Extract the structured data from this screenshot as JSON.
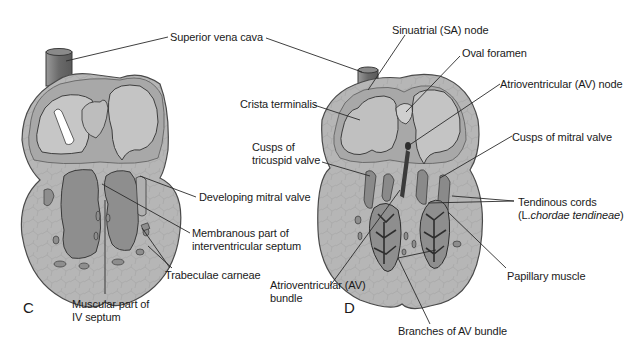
{
  "figure": {
    "panels": [
      {
        "id": "C",
        "letter": "C",
        "labels": {
          "superior_vena_cava": "Superior vena cava",
          "developing_mitral_valve": "Developing mitral valve",
          "membranous_part_line1": "Membranous part of",
          "membranous_part_line2": "interventricular septum",
          "trabeculae_carneae": "Trabeculae carneae",
          "muscular_part_line1": "Muscular part of",
          "muscular_part_line2": "IV septum"
        }
      },
      {
        "id": "D",
        "letter": "D",
        "labels": {
          "sa_node": "Sinuatrial (SA) node",
          "oval_foramen": "Oval foramen",
          "crista_terminalis": "Crista terminalis",
          "av_node": "Atrioventricular (AV) node",
          "cusps_tricuspid_line1": "Cusps of",
          "cusps_tricuspid_line2": "tricuspid valve",
          "cusps_mitral": "Cusps of mitral valve",
          "tendinous_cords_line1": "Tendinous cords",
          "tendinous_cords_line2_prefix": "(L.",
          "tendinous_cords_line2_italic": "chordae tendineae",
          "tendinous_cords_line2_suffix": ")",
          "av_bundle_line1": "Atrioventricular (AV)",
          "av_bundle_line2": "bundle",
          "papillary_muscle": "Papillary muscle",
          "branches_av_bundle": "Branches of AV bundle"
        }
      }
    ],
    "colors": {
      "wall": "#a9a9a9",
      "wall_outline": "#4a4a4a",
      "chamber": "#c4c4c4",
      "chamber_dark": "#8c8c8c",
      "myocardium": "#b3b3b3",
      "vessel": "#7a7a7a",
      "conduction": "#3c3c3c",
      "label_text": "#1a1a1a",
      "leader_line": "#2a2a2a"
    }
  }
}
